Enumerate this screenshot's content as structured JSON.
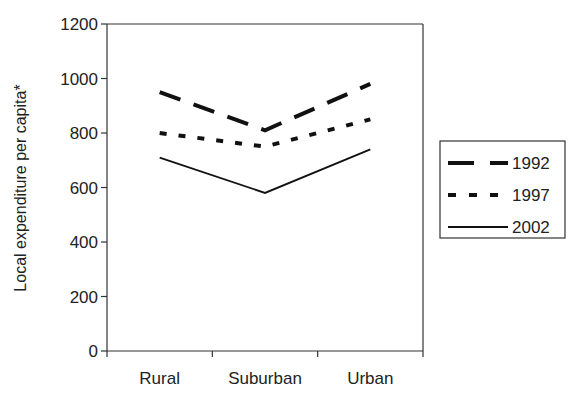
{
  "chart_data": {
    "type": "line",
    "title": "",
    "xlabel": "",
    "ylabel": "Local expenditure per capita*",
    "categories": [
      "Rural",
      "Suburban",
      "Urban"
    ],
    "yticks": [
      "0",
      "200",
      "400",
      "600",
      "800",
      "1000",
      "1200"
    ],
    "ylim": [
      0,
      1200
    ],
    "grid": false,
    "legend_position": "right",
    "series": [
      {
        "name": "1992",
        "style": "long-dash",
        "values": [
          950,
          810,
          980
        ]
      },
      {
        "name": "1997",
        "style": "short-dash",
        "values": [
          800,
          750,
          850
        ]
      },
      {
        "name": "2002",
        "style": "solid",
        "values": [
          710,
          580,
          740
        ]
      }
    ]
  }
}
